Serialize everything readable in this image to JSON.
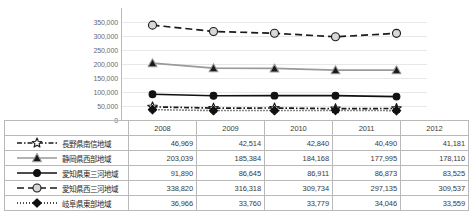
{
  "chart_data": {
    "type": "line",
    "title": "",
    "xlabel": "",
    "ylabel": "",
    "categories": [
      "2008",
      "2009",
      "2010",
      "2011",
      "2012"
    ],
    "ylim": [
      0,
      400000
    ],
    "yticks": [
      0,
      50000,
      100000,
      150000,
      200000,
      250000,
      300000,
      350000
    ],
    "ytick_labels": [
      "0",
      "50,000",
      "100,000",
      "150,000",
      "200,000",
      "250,000",
      "300,000",
      "350,000"
    ],
    "grid": true,
    "legend_position": "table-left",
    "series": [
      {
        "name": "長野県南信地域",
        "values": [
          46969,
          42514,
          42840,
          40490,
          41181
        ],
        "display_values": [
          "46,969",
          "42,514",
          "42,840",
          "40,490",
          "41,181"
        ],
        "marker": "open-star",
        "line_style": "dash-dot",
        "color": "#1a1a1a",
        "marker_fill": "#ffffff"
      },
      {
        "name": "静岡県西部地域",
        "values": [
          203039,
          185384,
          184168,
          177995,
          178110
        ],
        "display_values": [
          "203,039",
          "185,384",
          "184,168",
          "177,995",
          "178,110"
        ],
        "marker": "filled-triangle",
        "line_style": "solid",
        "color": "#9a9a9a",
        "marker_fill": "#1a1a1a"
      },
      {
        "name": "愛知県東三河地域",
        "values": [
          91890,
          86645,
          86911,
          86873,
          83525
        ],
        "display_values": [
          "91,890",
          "86,645",
          "86,911",
          "86,873",
          "83,525"
        ],
        "marker": "filled-circle",
        "line_style": "solid",
        "color": "#111111",
        "marker_fill": "#111111"
      },
      {
        "name": "愛知県西三河地域",
        "values": [
          338820,
          316318,
          309734,
          297135,
          309537
        ],
        "display_values": [
          "338,820",
          "316,318",
          "309,734",
          "297,135",
          "309,537"
        ],
        "marker": "open-circle",
        "line_style": "dashed",
        "color": "#1a1a1a",
        "marker_fill": "#d8d8d8"
      },
      {
        "name": "岐阜県東部地域",
        "values": [
          36966,
          33760,
          33779,
          34046,
          33559
        ],
        "display_values": [
          "36,966",
          "33,760",
          "33,779",
          "34,046",
          "33,559"
        ],
        "marker": "filled-diamond",
        "line_style": "dotted",
        "color": "#111111",
        "marker_fill": "#111111"
      }
    ]
  },
  "table": {
    "corner_label": "",
    "year_headers": [
      "2008",
      "2009",
      "2010",
      "2011",
      "2012"
    ]
  }
}
